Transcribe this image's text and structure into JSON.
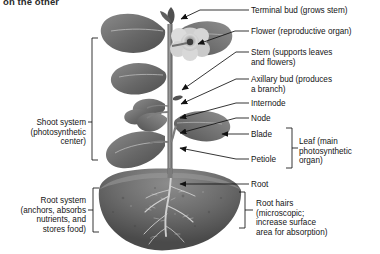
{
  "figure": {
    "cropped_heading": "on the other",
    "background_color": "#ffffff",
    "line_color": "#1a1a1a",
    "soil_color": "#6e6e6e",
    "plant_color": "#707070"
  },
  "left_labels": [
    {
      "id": "shoot-system",
      "text": "Shoot system\n(photosynthetic\ncenter)"
    },
    {
      "id": "root-system",
      "text": "Root system\n(anchors, absorbs\nnutrients, and\nstores food)"
    }
  ],
  "right_labels": [
    {
      "id": "terminal-bud",
      "text": "Terminal bud (grows stem)"
    },
    {
      "id": "flower",
      "text": "Flower (reproductive organ)"
    },
    {
      "id": "stem",
      "text": "Stem (supports leaves\nand flowers)"
    },
    {
      "id": "axillary-bud",
      "text": "Axillary bud (produces\na branch)"
    },
    {
      "id": "internode",
      "text": "Internode"
    },
    {
      "id": "node",
      "text": "Node"
    },
    {
      "id": "blade",
      "text": "Blade"
    },
    {
      "id": "petiole",
      "text": "Petiole"
    },
    {
      "id": "leaf",
      "text": "Leaf (main\nphotosynthetic\norgan)"
    },
    {
      "id": "root",
      "text": "Root"
    },
    {
      "id": "root-hairs",
      "text": "Root hairs\n(microscopic;\nincrease surface\narea for absorption)"
    }
  ]
}
